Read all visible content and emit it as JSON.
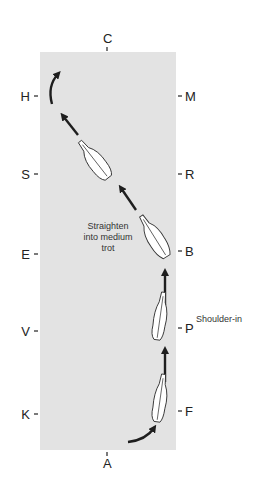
{
  "diagram": {
    "arena_color": "#e3e3e3",
    "ink_color": "#1e1e1e",
    "letters": {
      "top": "C",
      "bottom": "A",
      "left": [
        "H",
        "S",
        "E",
        "V",
        "K"
      ],
      "right": [
        "M",
        "R",
        "B",
        "P",
        "F"
      ]
    },
    "annotations": {
      "straighten": [
        "Straighten",
        "into medium",
        "trot"
      ],
      "shoulder_in": "Shoulder-in"
    },
    "icons": {
      "horse": "horse-topview-icon",
      "arrow": "arrow-icon",
      "curved_arrow": "curved-arrow-icon"
    }
  }
}
